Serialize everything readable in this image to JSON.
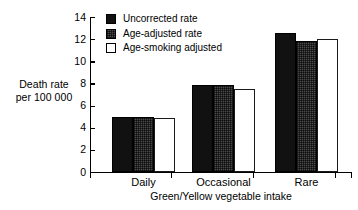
{
  "chart_data": {
    "type": "bar",
    "title": "",
    "xlabel": "Green/Yellow vegetable intake",
    "ylabel_line1": "Death rate",
    "ylabel_line2": "per 100 000",
    "categories": [
      "Daily",
      "Occasional",
      "Rare"
    ],
    "series": [
      {
        "name": "Uncorrected rate",
        "values": [
          5.0,
          7.9,
          12.6
        ],
        "swatch": "solid-black"
      },
      {
        "name": "Age-adjusted rate",
        "values": [
          5.0,
          7.9,
          11.8
        ],
        "swatch": "dark-gray-dither"
      },
      {
        "name": "Age-smoking adjusted",
        "values": [
          4.9,
          7.5,
          12.0
        ],
        "swatch": "white-outline"
      }
    ],
    "ylim": [
      0,
      14
    ],
    "yticks": [
      0,
      2,
      4,
      6,
      8,
      10,
      12,
      14
    ],
    "ytick_labels": [
      "0",
      "2",
      "4",
      "6",
      "8",
      "10",
      "12",
      "14"
    ],
    "grid": false,
    "legend_position": "top-left-inside",
    "colors": {
      "series_0": "#111111",
      "series_1": "#4c4c4c",
      "series_2": "#ffffff",
      "axis": "#000000",
      "background": "#ffffff"
    }
  }
}
